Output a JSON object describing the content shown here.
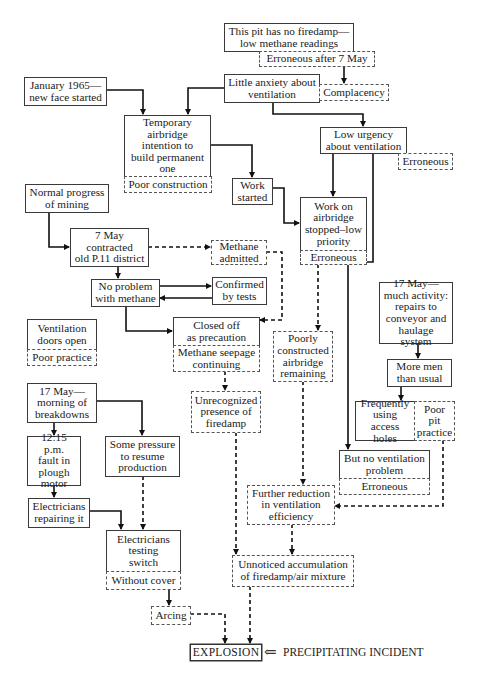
{
  "header": {
    "running_head": "HUMAN ERROR CONTEXT"
  },
  "nodes": {
    "pit_no_firedamp": "This pit has no firedamp—\nlow methane readings",
    "erroneous_after_7may": "Erroneous after 7 May",
    "jan_1965": "January 1965—\nnew face started",
    "little_anxiety": "Little anxiety about\nventilation",
    "complacency": "Complacency",
    "temp_airbridge": "Temporary\nairbridge\nintention to\nbuild permanent\none",
    "poor_construction": "Poor construction",
    "low_urgency": "Low urgency\nabout ventilation",
    "erroneous_1": "Erroneous",
    "work_started": "Work\nstarted",
    "normal_progress": "Normal progress\nof mining",
    "work_stopped": "Work on\nairbridge\nstopped–low\npriority",
    "erroneous_2": "Erroneous",
    "may7_contracted": "7 May\ncontracted\nold P.11 district",
    "methane_admitted": "Methane\nadmitted",
    "no_problem_methane": "No problem\nwith methane",
    "confirmed_tests": "Confirmed\nby tests",
    "may17_activity": "17 May—\nmuch activity:\nrepairs to\nconveyor and\nhaulage system",
    "vent_doors_open": "Ventilation\ndoors open",
    "poor_practice": "Poor practice",
    "closed_off": "Closed off\nas precaution",
    "methane_seepage": "Methane seepage\ncontinuing",
    "poorly_constructed": "Poorly\nconstructed\nairbridge\nremaining",
    "more_men": "More men\nthan usual",
    "may17_breakdowns": "17 May—\nmorning of\nbreakdowns",
    "unrecognized_firedamp": "Unrecognized\npresence of\nfiredamp",
    "freq_access_holes": "Frequently\nusing access\nholes",
    "poor_pit_practice": "Poor\npit\npractice",
    "fault_plough": "12:15 p.m.\nfault in\nplough\nmotor",
    "some_pressure": "Some pressure\nto resume\nproduction",
    "no_vent_problem": "But no ventilation\nproblem",
    "erroneous_3": "Erroneous",
    "further_reduction": "Further reduction\nin ventilation\nefficiency",
    "electricians_repairing": "Electricians\nrepairing it",
    "electricians_testing": "Electricians\ntesting\nswitch",
    "without_cover": "Without cover",
    "unnoticed_accumulation": "Unnoticed accumulation\nof firedamp/air mixture",
    "arcing": "Arcing",
    "explosion": "EXPLOSION"
  },
  "annotation": {
    "arrow": "⇐",
    "precipitating": "PRECIPITATING INCIDENT"
  },
  "legend": {
    "solid_line": "causal link",
    "dashed_line": "latent / erroneous link"
  }
}
